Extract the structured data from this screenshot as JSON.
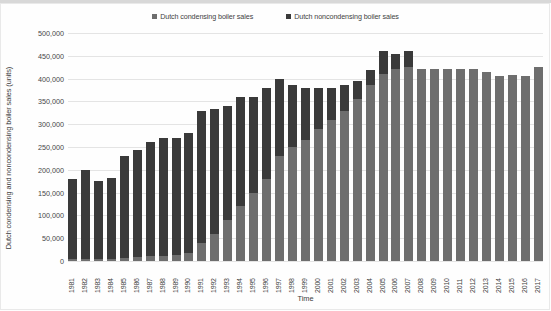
{
  "chart_data": {
    "type": "bar",
    "subtype": "stacked-bar",
    "title": "",
    "xlabel": "Time",
    "ylabel": "Dutch condensing and noncondensing boiler sales (units)",
    "ylim": [
      0,
      500000
    ],
    "ytick_labels": [
      "500,000",
      "450,000",
      "400,000",
      "350,000",
      "300,000",
      "250,000",
      "200,000",
      "150,000",
      "100,000",
      "50,000",
      "0"
    ],
    "ytick_values": [
      500000,
      450000,
      400000,
      350000,
      300000,
      250000,
      200000,
      150000,
      100000,
      50000,
      0
    ],
    "grid": true,
    "legend_position": "top-center",
    "categories": [
      "1981",
      "1982",
      "1983",
      "1984",
      "1985",
      "1986",
      "1987",
      "1988",
      "1989",
      "1990",
      "1991",
      "1992",
      "1993",
      "1994",
      "1995",
      "1996",
      "1997",
      "1998",
      "1999",
      "2000",
      "2001",
      "2002",
      "2003",
      "2004",
      "2005",
      "2006",
      "2007",
      "2008",
      "2009",
      "2010",
      "2011",
      "2012",
      "2013",
      "2014",
      "2015",
      "2016",
      "2017"
    ],
    "series": [
      {
        "name": "Dutch condensing boiler sales",
        "color": "#6e6e6e",
        "values": [
          4000,
          4000,
          4000,
          5000,
          6000,
          8000,
          10000,
          12000,
          14000,
          18000,
          40000,
          60000,
          90000,
          120000,
          150000,
          180000,
          230000,
          250000,
          265000,
          290000,
          310000,
          330000,
          355000,
          385000,
          410000,
          420000,
          425000,
          420000,
          420000,
          420000,
          420000,
          420000,
          415000,
          405000,
          408000,
          405000,
          425000
        ]
      },
      {
        "name": "Dutch noncondensing boiler sales",
        "color": "#3a3a3a",
        "values": [
          176000,
          196000,
          171000,
          178000,
          224000,
          236000,
          250000,
          258000,
          256000,
          262000,
          288000,
          273000,
          250000,
          240000,
          210000,
          200000,
          170000,
          135000,
          115000,
          90000,
          70000,
          55000,
          40000,
          35000,
          50000,
          35000,
          35000,
          0,
          0,
          0,
          0,
          0,
          0,
          0,
          0,
          0,
          0
        ]
      }
    ],
    "totals": [
      180000,
      200000,
      175000,
      183000,
      230000,
      244000,
      260000,
      270000,
      270000,
      280000,
      328000,
      333000,
      340000,
      360000,
      360000,
      380000,
      400000,
      385000,
      380000,
      380000,
      380000,
      385000,
      395000,
      420000,
      460000,
      455000,
      460000,
      420000,
      420000,
      420000,
      420000,
      420000,
      415000,
      405000,
      408000,
      405000,
      425000
    ]
  },
  "legend": {
    "entries": [
      {
        "label": "Dutch condensing boiler sales",
        "color": "#6e6e6e"
      },
      {
        "label": "Dutch noncondensing boiler sales",
        "color": "#3a3a3a"
      }
    ]
  }
}
